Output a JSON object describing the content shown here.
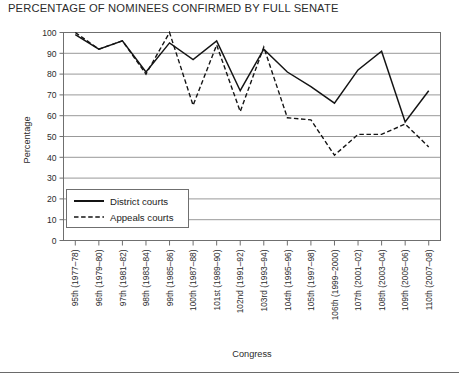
{
  "title": "PERCENTAGE OF NOMINEES CONFIRMED BY FULL SENATE",
  "axis": {
    "y_title": "Percentage",
    "x_title": "Congress"
  },
  "legend": {
    "items": [
      {
        "label": "District courts",
        "style": "solid"
      },
      {
        "label": "Appeals courts",
        "style": "dashed"
      }
    ]
  },
  "chart_data": {
    "type": "line",
    "title": "PERCENTAGE OF NOMINEES CONFIRMED BY FULL SENATE",
    "xlabel": "Congress",
    "ylabel": "Percentage",
    "ylim": [
      0,
      100
    ],
    "yticks": [
      0,
      10,
      20,
      30,
      40,
      50,
      60,
      70,
      80,
      90,
      100
    ],
    "grid": true,
    "legend_position": "inside-lower-left",
    "categories": [
      "95th (1977–78)",
      "96th (1979–80)",
      "97th (1981–82)",
      "98th (1983–84)",
      "99th (1985–86)",
      "100th (1987–88)",
      "101st (1989–90)",
      "102nd (1991–92)",
      "103rd (1993–94)",
      "104th (1995–96)",
      "105th (1997–98)",
      "106th (1999–2000)",
      "107th (2001–02)",
      "108th (2003–04)",
      "109th (2005–06)",
      "110th (2007–08)"
    ],
    "series": [
      {
        "name": "District courts",
        "style": "solid",
        "values": [
          99,
          92,
          96,
          81,
          95,
          87,
          96,
          72,
          92,
          81,
          74,
          66,
          82,
          91,
          57,
          72
        ]
      },
      {
        "name": "Appeals courts",
        "style": "dashed",
        "values": [
          100,
          92,
          96,
          80,
          100,
          65,
          94,
          62,
          93,
          59,
          58,
          41,
          51,
          51,
          56,
          45
        ]
      }
    ]
  }
}
